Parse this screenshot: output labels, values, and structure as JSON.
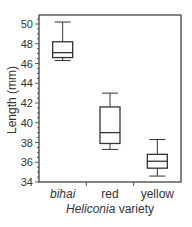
{
  "chart_data": {
    "type": "boxplot",
    "title": "",
    "xlabel_italic": "Heliconia",
    "xlabel_rest": " variety",
    "xlabel": "Heliconia variety",
    "ylabel": "Length (mm)",
    "ylim": [
      34,
      50.8
    ],
    "yticks": [
      34,
      36,
      38,
      40,
      42,
      44,
      46,
      48,
      50
    ],
    "grid": false,
    "categories": [
      "bihai",
      "red",
      "yellow"
    ],
    "category_italic": [
      true,
      false,
      false
    ],
    "series": [
      {
        "name": "bihai",
        "whisker_low": 46.3,
        "q1": 46.6,
        "median": 47.1,
        "q3": 48.2,
        "whisker_high": 50.2
      },
      {
        "name": "red",
        "whisker_low": 37.3,
        "q1": 37.9,
        "median": 39.0,
        "q3": 41.6,
        "whisker_high": 43.0
      },
      {
        "name": "yellow",
        "whisker_low": 34.6,
        "q1": 35.4,
        "median": 36.1,
        "q3": 36.8,
        "whisker_high": 38.3
      }
    ]
  },
  "colors": {
    "axis": "#333333",
    "box": "#333333",
    "fill": "#ffffff"
  }
}
